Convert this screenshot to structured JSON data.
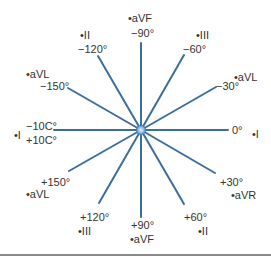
{
  "diagram": {
    "center": {
      "x": 141,
      "y": 130
    },
    "radius": 87,
    "line_color": "#3c6e9c",
    "center_dot_color": "#8ab8e6",
    "rule_color": "#8a8a8a",
    "axes": [
      {
        "angle": -90,
        "label": "−90°",
        "lead": "•aVF"
      },
      {
        "angle": -60,
        "label": "−60°",
        "lead": "•III"
      },
      {
        "angle": -30,
        "label": "−30°",
        "lead": "•aVL"
      },
      {
        "angle": 0,
        "label": "0°",
        "lead": "•I"
      },
      {
        "angle": 30,
        "label": "+30°",
        "lead": "•aVR"
      },
      {
        "angle": 60,
        "label": "+60°",
        "lead": "•II"
      },
      {
        "angle": 90,
        "label": "+90°",
        "lead": "•aVF"
      },
      {
        "angle": 120,
        "label": "+120°",
        "lead": "•III"
      },
      {
        "angle": 150,
        "label": "+150°",
        "lead": "•aVL"
      },
      {
        "angle": 180,
        "label_top": "−10C°",
        "label_bottom": "+10C°",
        "lead": "•I"
      },
      {
        "angle": -150,
        "label": "−150°",
        "lead": "•aVL"
      },
      {
        "angle": -120,
        "label": "−120°",
        "lead": "•II"
      }
    ]
  }
}
